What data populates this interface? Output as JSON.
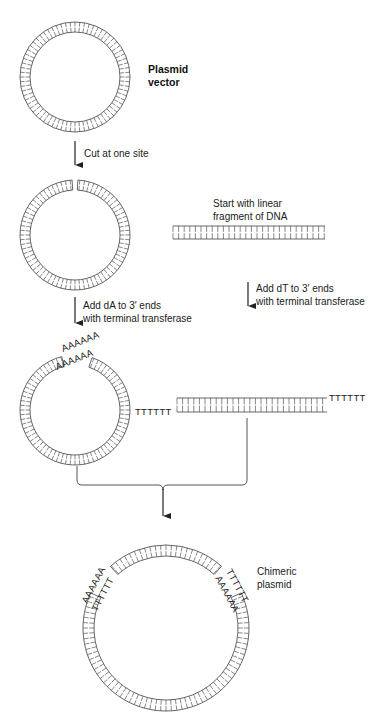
{
  "colors": {
    "line": "#555555",
    "arrow": "#222222",
    "text": "#1a1a1a",
    "background": "#ffffff"
  },
  "labels": {
    "plasmid_vector": [
      "Plasmid",
      "vector"
    ],
    "step_cut": "Cut at one site",
    "linear_fragment": [
      "Start with linear",
      "fragment of DNA"
    ],
    "step_add_dA": [
      "Add dA to 3′ ends",
      "with terminal transferase"
    ],
    "step_add_dT": [
      "Add dT to 3′ ends",
      "with terminal transferase"
    ],
    "chimeric_plasmid": [
      "Chimeric",
      "plasmid"
    ]
  },
  "sequences": {
    "poly_A_tail": "AAAAAA",
    "poly_T_tail": "TTTTTT"
  },
  "stages": [
    {
      "name": "plasmid-vector",
      "shape": "circle",
      "cut": false
    },
    {
      "name": "cut-plasmid",
      "shape": "circle",
      "cut": true
    },
    {
      "name": "linear-fragment",
      "shape": "linear"
    },
    {
      "name": "dA-tailed-plasmid",
      "shape": "circle",
      "tails": "AAAAAA"
    },
    {
      "name": "dT-tailed-fragment",
      "shape": "linear",
      "tails": "TTTTTT"
    },
    {
      "name": "chimeric-plasmid",
      "shape": "circle",
      "junctions": [
        "AAAAAA/TTTTTT",
        "TTTTTT/AAAAAA"
      ]
    }
  ]
}
